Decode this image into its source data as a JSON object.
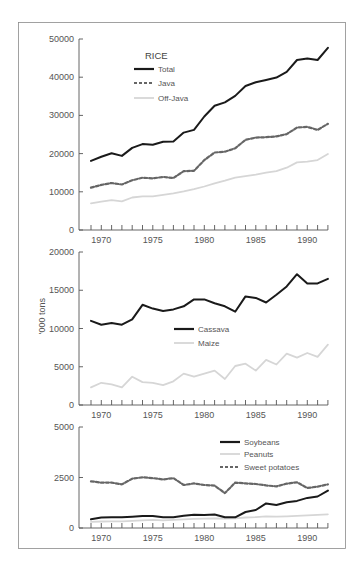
{
  "ylabel": "'000 tons",
  "colors": {
    "solid": "#1a1a1a",
    "dashed": "#666666",
    "light": "#d6d6d6",
    "frame": "#888888"
  },
  "chart_data": [
    {
      "type": "line",
      "title": "RICE",
      "xlabel": "",
      "ylabel": "'000 tons",
      "x": [
        1969,
        1970,
        1971,
        1972,
        1973,
        1974,
        1975,
        1976,
        1977,
        1978,
        1979,
        1980,
        1981,
        1982,
        1983,
        1984,
        1985,
        1986,
        1987,
        1988,
        1989,
        1990,
        1991,
        1992
      ],
      "xticks": [
        1970,
        1975,
        1980,
        1985,
        1990
      ],
      "yticks": [
        0,
        10000,
        20000,
        30000,
        40000,
        50000
      ],
      "ylim": [
        0,
        50000
      ],
      "grid": false,
      "legend_position": "upper left",
      "series": [
        {
          "name": "Total",
          "style": "solid",
          "values": [
            18100,
            19200,
            20100,
            19400,
            21500,
            22500,
            22300,
            23100,
            23200,
            25500,
            26200,
            29700,
            32500,
            33400,
            35100,
            37700,
            38700,
            39300,
            39900,
            41400,
            44500,
            44900,
            44500,
            47700
          ]
        },
        {
          "name": "Java",
          "style": "dashed",
          "values": [
            11100,
            11800,
            12300,
            11900,
            13000,
            13700,
            13500,
            13900,
            13600,
            15400,
            15500,
            18300,
            20300,
            20500,
            21400,
            23600,
            24200,
            24300,
            24500,
            25100,
            26800,
            27000,
            26200,
            27800
          ]
        },
        {
          "name": "Off-Java",
          "style": "light",
          "values": [
            7000,
            7400,
            7800,
            7500,
            8500,
            8800,
            8800,
            9200,
            9600,
            10100,
            10700,
            11400,
            12200,
            12900,
            13700,
            14100,
            14500,
            15000,
            15400,
            16300,
            17700,
            17900,
            18300,
            19900
          ]
        }
      ]
    },
    {
      "type": "line",
      "title": "",
      "xlabel": "",
      "ylabel": "'000 tons",
      "x": [
        1969,
        1970,
        1971,
        1972,
        1973,
        1974,
        1975,
        1976,
        1977,
        1978,
        1979,
        1980,
        1981,
        1982,
        1983,
        1984,
        1985,
        1986,
        1987,
        1988,
        1989,
        1990,
        1991,
        1992
      ],
      "xticks": [
        1970,
        1975,
        1980,
        1985,
        1990
      ],
      "yticks": [
        0,
        5000,
        10000,
        15000,
        20000
      ],
      "ylim": [
        0,
        20000
      ],
      "grid": false,
      "legend_position": "center",
      "series": [
        {
          "name": "Cassava",
          "style": "solid",
          "values": [
            11000,
            10500,
            10700,
            10500,
            11200,
            13100,
            12600,
            12300,
            12500,
            12900,
            13800,
            13800,
            13300,
            12900,
            12200,
            14200,
            14000,
            13400,
            14400,
            15500,
            17100,
            15900,
            15900,
            16500
          ]
        },
        {
          "name": "Maize",
          "style": "light",
          "values": [
            2300,
            2900,
            2700,
            2300,
            3700,
            3000,
            2900,
            2600,
            3100,
            4100,
            3700,
            4100,
            4500,
            3400,
            5100,
            5400,
            4500,
            5900,
            5300,
            6700,
            6200,
            6800,
            6300,
            7900
          ]
        }
      ]
    },
    {
      "type": "line",
      "title": "",
      "xlabel": "",
      "ylabel": "'000 tons",
      "x": [
        1969,
        1970,
        1971,
        1972,
        1973,
        1974,
        1975,
        1976,
        1977,
        1978,
        1979,
        1980,
        1981,
        1982,
        1983,
        1984,
        1985,
        1986,
        1987,
        1988,
        1989,
        1990,
        1991,
        1992
      ],
      "xticks": [
        1970,
        1975,
        1980,
        1985,
        1990
      ],
      "yticks": [
        0,
        2500,
        5000
      ],
      "ylim": [
        0,
        5000
      ],
      "grid": false,
      "legend_position": "upper right",
      "series": [
        {
          "name": "Soybeans",
          "style": "solid",
          "values": [
            430,
            520,
            530,
            530,
            560,
            590,
            590,
            530,
            530,
            610,
            660,
            640,
            670,
            530,
            530,
            790,
            890,
            1220,
            1140,
            1270,
            1340,
            1490,
            1560,
            1850
          ]
        },
        {
          "name": "Peanuts",
          "style": "light",
          "values": [
            300,
            320,
            330,
            330,
            350,
            380,
            400,
            380,
            400,
            430,
            450,
            460,
            480,
            460,
            480,
            520,
            540,
            580,
            560,
            580,
            600,
            630,
            650,
            680
          ]
        },
        {
          "name": "Sweet potatoes",
          "style": "dashed",
          "values": [
            2310,
            2250,
            2250,
            2160,
            2440,
            2510,
            2470,
            2400,
            2470,
            2130,
            2210,
            2130,
            2100,
            1730,
            2250,
            2210,
            2180,
            2110,
            2060,
            2200,
            2260,
            1980,
            2050,
            2160
          ]
        }
      ]
    }
  ]
}
